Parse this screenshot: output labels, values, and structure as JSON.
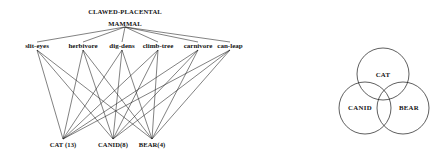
{
  "figure": {
    "background_color": "#ffffff",
    "line_color": "#1a1a1a",
    "text_color": "#141414"
  },
  "tree": {
    "root_label": "CLAWED-PLACENTAL",
    "root_sub_label": "MAMMAL",
    "features": [
      {
        "label": "slit-eyes",
        "x": 37,
        "y": 48
      },
      {
        "label": "herbivore",
        "x": 83,
        "y": 48
      },
      {
        "label": "dig-dens",
        "x": 122,
        "y": 48
      },
      {
        "label": "climb-tree",
        "x": 158,
        "y": 48
      },
      {
        "label": "carnivore",
        "x": 198,
        "y": 48
      },
      {
        "label": "can-leap",
        "x": 230,
        "y": 48
      }
    ],
    "leaves": [
      {
        "label": "CAT (13)",
        "name": "CAT",
        "count": 13,
        "x": 63,
        "y": 147
      },
      {
        "label": "CANID(8)",
        "name": "CANID",
        "count": 8,
        "x": 113,
        "y": 147
      },
      {
        "label": "BEAR(4)",
        "name": "BEAR",
        "count": 4,
        "x": 152,
        "y": 147
      }
    ],
    "root_node": {
      "x": 125,
      "y": 27
    },
    "feature_anchor_y": 42,
    "leaf_anchor_y": 139,
    "root_to_feature_edges": [
      0,
      1,
      2,
      3,
      4,
      5
    ],
    "feature_to_leaf_edges": [
      {
        "feature": 0,
        "leaves": [
          0,
          1,
          2
        ]
      },
      {
        "feature": 1,
        "leaves": [
          0,
          1,
          2
        ]
      },
      {
        "feature": 2,
        "leaves": [
          0,
          1,
          2
        ]
      },
      {
        "feature": 3,
        "leaves": [
          0,
          1,
          2
        ]
      },
      {
        "feature": 4,
        "leaves": [
          0,
          1,
          2
        ]
      },
      {
        "feature": 5,
        "leaves": [
          0,
          1,
          2
        ]
      }
    ]
  },
  "venn": {
    "circles": [
      {
        "label": "CAT",
        "cx": 383,
        "cy": 74,
        "r": 26
      },
      {
        "label": "CANID",
        "cx": 365,
        "cy": 108,
        "r": 26
      },
      {
        "label": "BEAR",
        "cx": 403,
        "cy": 108,
        "r": 26
      }
    ]
  }
}
